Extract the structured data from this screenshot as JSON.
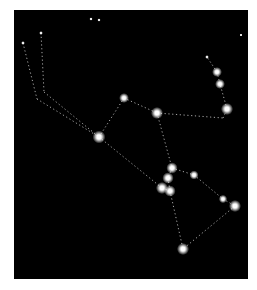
{
  "image": {
    "subject": "constellation diagram",
    "background_color": "#000000",
    "frame": {
      "x": 14,
      "y": 10,
      "width": 234,
      "height": 269
    },
    "star_color": "#ffffff",
    "line_color": "#cfcfcf"
  },
  "stars": [
    {
      "id": "s1",
      "x": 124,
      "y": 98,
      "r": 2.6
    },
    {
      "id": "s2",
      "x": 157,
      "y": 113,
      "r": 3.2
    },
    {
      "id": "s3",
      "x": 99,
      "y": 137,
      "r": 3.4
    },
    {
      "id": "s4",
      "x": 217,
      "y": 72,
      "r": 2.6
    },
    {
      "id": "s5",
      "x": 220,
      "y": 84,
      "r": 2.6
    },
    {
      "id": "s6",
      "x": 227,
      "y": 109,
      "r": 3.2
    },
    {
      "id": "s7",
      "x": 172,
      "y": 168,
      "r": 3.0
    },
    {
      "id": "s8",
      "x": 194,
      "y": 175,
      "r": 2.4
    },
    {
      "id": "s9",
      "x": 168,
      "y": 178,
      "r": 3.0
    },
    {
      "id": "s10",
      "x": 162,
      "y": 188,
      "r": 3.2
    },
    {
      "id": "s11",
      "x": 170,
      "y": 191,
      "r": 3.0
    },
    {
      "id": "s12",
      "x": 223,
      "y": 199,
      "r": 2.2
    },
    {
      "id": "s13",
      "x": 235,
      "y": 206,
      "r": 3.2
    },
    {
      "id": "s14",
      "x": 183,
      "y": 249,
      "r": 3.2
    },
    {
      "id": "s15",
      "x": 91,
      "y": 19,
      "r": 0.9
    },
    {
      "id": "s16",
      "x": 99,
      "y": 20,
      "r": 0.9
    },
    {
      "id": "s17",
      "x": 241,
      "y": 35,
      "r": 0.8
    },
    {
      "id": "s18",
      "x": 23,
      "y": 43,
      "r": 1.0
    },
    {
      "id": "s19",
      "x": 41,
      "y": 33,
      "r": 1.0
    },
    {
      "id": "s20",
      "x": 207,
      "y": 57,
      "r": 1.0
    }
  ],
  "lines": [
    [
      23,
      43,
      37,
      99
    ],
    [
      37,
      99,
      99,
      137
    ],
    [
      41,
      33,
      44,
      92
    ],
    [
      44,
      92,
      99,
      137
    ],
    [
      99,
      137,
      124,
      98
    ],
    [
      124,
      98,
      157,
      113
    ],
    [
      157,
      113,
      223,
      118
    ],
    [
      223,
      118,
      227,
      109
    ],
    [
      227,
      109,
      220,
      84
    ],
    [
      220,
      84,
      217,
      72
    ],
    [
      217,
      72,
      207,
      57
    ],
    [
      157,
      113,
      172,
      168
    ],
    [
      99,
      137,
      162,
      188
    ],
    [
      172,
      168,
      194,
      175
    ],
    [
      194,
      175,
      223,
      199
    ],
    [
      223,
      199,
      235,
      206
    ],
    [
      172,
      168,
      168,
      178
    ],
    [
      168,
      178,
      170,
      191
    ],
    [
      162,
      188,
      170,
      191
    ],
    [
      170,
      191,
      183,
      249
    ],
    [
      235,
      206,
      183,
      249
    ]
  ]
}
